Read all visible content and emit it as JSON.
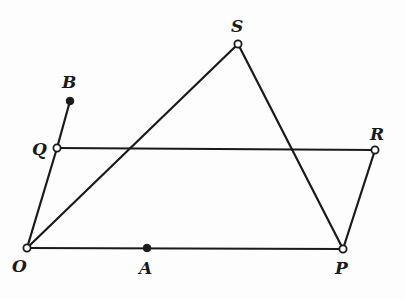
{
  "diagram": {
    "type": "geometric-figure",
    "width": 405,
    "height": 299,
    "points": [
      {
        "id": "O",
        "label": "O",
        "x": 27,
        "y": 248,
        "style": "open",
        "label_x": 12,
        "label_y": 272
      },
      {
        "id": "A",
        "label": "A",
        "x": 147,
        "y": 248,
        "style": "filled",
        "label_x": 139,
        "label_y": 274
      },
      {
        "id": "P",
        "label": "P",
        "x": 343,
        "y": 249,
        "style": "open",
        "label_x": 335,
        "label_y": 274
      },
      {
        "id": "Q",
        "label": "Q",
        "x": 57,
        "y": 148,
        "style": "open",
        "label_x": 32,
        "label_y": 155
      },
      {
        "id": "R",
        "label": "R",
        "x": 375,
        "y": 150,
        "style": "open",
        "label_x": 370,
        "label_y": 140
      },
      {
        "id": "B",
        "label": "B",
        "x": 70,
        "y": 101,
        "style": "filled",
        "label_x": 62,
        "label_y": 88
      },
      {
        "id": "S",
        "label": "S",
        "x": 238,
        "y": 44,
        "style": "open",
        "label_x": 231,
        "label_y": 32
      }
    ],
    "segments": [
      {
        "from": "O",
        "to": "P"
      },
      {
        "from": "O",
        "to": "Q"
      },
      {
        "from": "Q",
        "to": "B"
      },
      {
        "from": "Q",
        "to": "R"
      },
      {
        "from": "R",
        "to": "P"
      },
      {
        "from": "O",
        "to": "S"
      },
      {
        "from": "S",
        "to": "P"
      }
    ],
    "colors": {
      "line": "#1a1a1a",
      "background": "#fdfdfd"
    }
  }
}
